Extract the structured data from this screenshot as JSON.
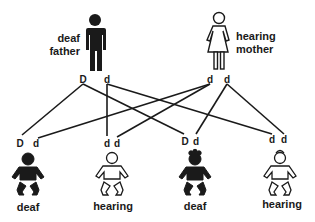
{
  "parents": {
    "father": {
      "line1": "deaf",
      "line2": "father",
      "alleles": [
        "D",
        "d"
      ],
      "phenotype": "deaf"
    },
    "mother": {
      "line1": "hearing",
      "line2": "mother",
      "alleles": [
        "d",
        "d"
      ],
      "phenotype": "hearing"
    }
  },
  "children": [
    {
      "alleles": [
        "D",
        "d"
      ],
      "label": "deaf",
      "filled": true
    },
    {
      "alleles": [
        "d",
        "d"
      ],
      "label": "hearing",
      "filled": false
    },
    {
      "alleles": [
        "D",
        "d"
      ],
      "label": "deaf",
      "filled": true
    },
    {
      "alleles": [
        "d",
        "d"
      ],
      "label": "hearing",
      "filled": false
    }
  ],
  "inheritance_lines": [
    {
      "from": "father.D",
      "to": "child1.D"
    },
    {
      "from": "father.D",
      "to": "child3.D"
    },
    {
      "from": "father.d",
      "to": "child2.d1"
    },
    {
      "from": "father.d",
      "to": "child4.d1"
    },
    {
      "from": "mother.d1",
      "to": "child1.d"
    },
    {
      "from": "mother.d1",
      "to": "child2.d2"
    },
    {
      "from": "mother.d2",
      "to": "child3.d"
    },
    {
      "from": "mother.d2",
      "to": "child4.d2"
    }
  ],
  "colors": {
    "ink": "#1a1a1a",
    "background": "#ffffff"
  }
}
